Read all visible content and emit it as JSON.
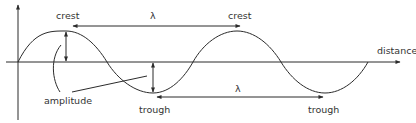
{
  "diagram": {
    "labels": {
      "crest_left": "crest",
      "crest_right": "crest",
      "wavelength_top": "λ",
      "wavelength_bottom": "λ",
      "distance": "distance",
      "amplitude": "amplitude",
      "trough_left": "trough",
      "trough_right": "trough"
    },
    "colors": {
      "line": "#2b2b2b",
      "text": "#333333",
      "background": "#ffffff"
    }
  }
}
